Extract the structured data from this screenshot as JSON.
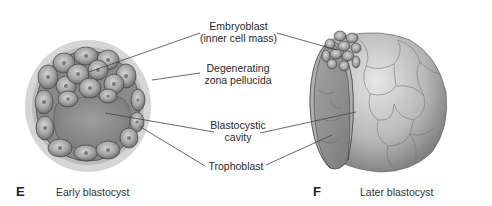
{
  "figure": {
    "labels": {
      "embryoblast_line1": "Embryoblast",
      "embryoblast_line2": "(inner cell mass)",
      "zona_line1": "Degenerating",
      "zona_line2": "zona pellucida",
      "cavity_line1": "Blastocystic",
      "cavity_line2": "cavity",
      "trophoblast": "Trophoblast"
    },
    "panels": [
      {
        "letter": "E",
        "caption": "Early blastocyst"
      },
      {
        "letter": "F",
        "caption": "Later blastocyst"
      }
    ],
    "colors": {
      "zona": "#d4d4d4",
      "zona_inner": "#bdbdbd",
      "cell": "#9a9a9a",
      "cell_edge": "#4a4a4a",
      "cavity": "#8c8c8c",
      "leader_line": "#444444"
    }
  }
}
